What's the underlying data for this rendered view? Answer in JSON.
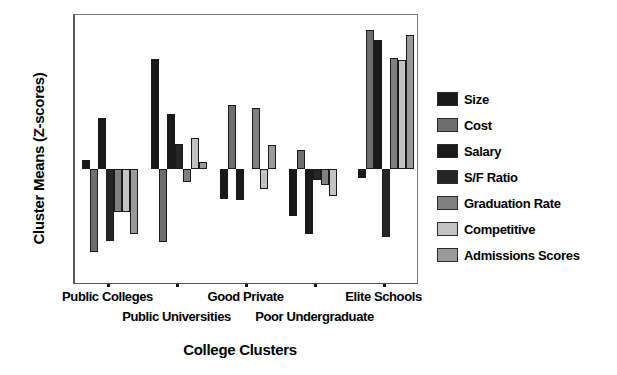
{
  "chart_data": {
    "type": "bar",
    "title": "",
    "xlabel": "College Clusters",
    "ylabel": "Cluster Means (Z-scores)",
    "ylim": [
      -1.5,
      2.0
    ],
    "ytick_labels": [
      "2.0",
      "1.5",
      "1.0",
      ".5",
      "0.0",
      "-.5",
      "-1.0",
      "-1.5"
    ],
    "ytick_values": [
      2.0,
      1.5,
      1.0,
      0.5,
      0.0,
      -0.5,
      -1.0,
      -1.5
    ],
    "grid": false,
    "legend_position": "right",
    "categories": [
      "Public Colleges",
      "Public Universities",
      "Good Private",
      "Poor Undergraduate",
      "Elite Schools"
    ],
    "series": [
      {
        "name": "Size",
        "color": "#191919",
        "values": [
          0.12,
          1.43,
          -0.38,
          -0.6,
          -0.11
        ]
      },
      {
        "name": "Cost",
        "color": "#6e6e6e",
        "values": [
          -1.07,
          -0.94,
          0.83,
          0.25,
          1.8
        ]
      },
      {
        "name": "Salary",
        "color": "#1a1a1a",
        "values": [
          0.67,
          0.72,
          -0.4,
          -0.84,
          1.67
        ]
      },
      {
        "name": "S/F Ratio",
        "color": "#262626",
        "values": [
          -0.93,
          0.33,
          0.0,
          -0.14,
          -0.88
        ]
      },
      {
        "name": "Graduation Rate",
        "color": "#808080",
        "values": [
          -0.55,
          -0.17,
          0.8,
          -0.21,
          1.44
        ]
      },
      {
        "name": "Competitive",
        "color": "#c2c2c2",
        "values": [
          -0.55,
          0.41,
          -0.25,
          -0.34,
          1.42
        ]
      },
      {
        "name": "Admissions Scores",
        "color": "#9a9a9a",
        "values": [
          -0.84,
          0.1,
          0.32,
          0.0,
          1.74
        ]
      }
    ]
  },
  "legend": {
    "items": [
      {
        "label": "Size"
      },
      {
        "label": "Cost"
      },
      {
        "label": "Salary"
      },
      {
        "label": "S/F Ratio"
      },
      {
        "label": "Graduation Rate"
      },
      {
        "label": "Competitive"
      },
      {
        "label": "Admissions Scores"
      }
    ]
  }
}
